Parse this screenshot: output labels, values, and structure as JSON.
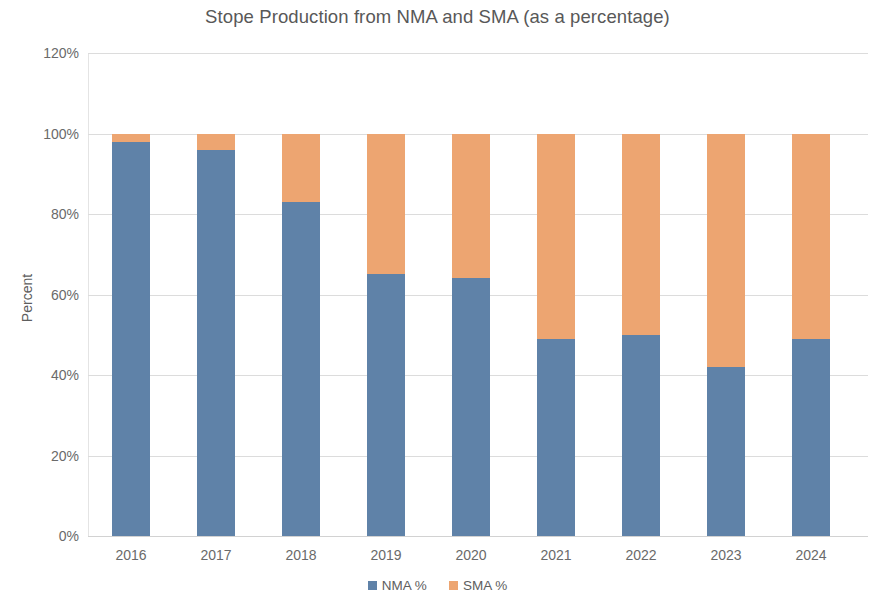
{
  "chart_data": {
    "type": "bar",
    "subtype": "stacked-percentage-column",
    "title": "Stope Production from NMA and SMA (as a percentage)",
    "xlabel": "",
    "ylabel": "Percent",
    "categories": [
      "2016",
      "2017",
      "2018",
      "2019",
      "2020",
      "2021",
      "2022",
      "2023",
      "2024"
    ],
    "series": [
      {
        "name": "NMA %",
        "color": "#5f82a8",
        "values": [
          98,
          96,
          83,
          65,
          64,
          49,
          50,
          42,
          49
        ]
      },
      {
        "name": "SMA %",
        "color": "#eda571",
        "values": [
          2,
          4,
          17,
          35,
          36,
          51,
          50,
          58,
          51
        ]
      }
    ],
    "ylim": [
      0,
      120
    ],
    "yticks": [
      "0%",
      "20%",
      "40%",
      "60%",
      "80%",
      "100%",
      "120%"
    ],
    "ytick_values": [
      0,
      20,
      40,
      60,
      80,
      100,
      120
    ],
    "grid": true,
    "legend_position": "bottom",
    "stack_total": 100
  },
  "legend": {
    "items": [
      {
        "label": "NMA %",
        "color": "#5f82a8"
      },
      {
        "label": "SMA %",
        "color": "#eda571"
      }
    ]
  }
}
